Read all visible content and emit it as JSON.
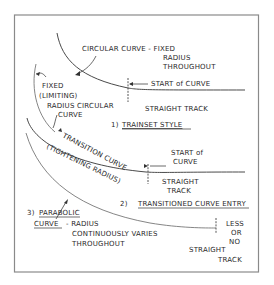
{
  "diagram": {
    "type": "hand-drawn technical sketch",
    "frame_color": "#8a8a8a",
    "ink_color": "#2a2a2a",
    "background": "#ffffff"
  },
  "section1": {
    "curve_label_line1": "CIRCULAR  CURVE - FIXED",
    "curve_label_line2": "RADIUS",
    "curve_label_line3": "THROUGHOUT",
    "start_label": "START of CURVE",
    "straight_label": "STRAIGHT TRACK",
    "caption_number": "1)",
    "caption_title": "TRAINSET  STYLE"
  },
  "section_fixed": {
    "line1": "FIXED",
    "line2": "(LIMITING)",
    "line3": "RADIUS CIRCULAR",
    "line4": "CURVE"
  },
  "section2": {
    "transition_label": "TRANSITION CURVE",
    "tightening_label": "(TIGHTENING RADIUS)",
    "start_line1": "START of",
    "start_line2": "CURVE",
    "straight_line1": "STRAIGHT",
    "straight_line2": "TRACK",
    "caption_number": "2)",
    "caption_title": "TRANSITIONED CURVE ENTRY"
  },
  "section3": {
    "caption_number": "3)",
    "title_line1": "PARABOLIC",
    "title_line2": "CURVE",
    "desc_line1": "- RADIUS",
    "desc_line2": "CONTINUOUSLY  VARIES",
    "desc_line3": "THROUGHOUT",
    "less_line1": "LESS",
    "less_line2": "OR",
    "less_line3": "NO",
    "straight_line1": "STRAIGHT",
    "straight_line2": "TRACK"
  }
}
